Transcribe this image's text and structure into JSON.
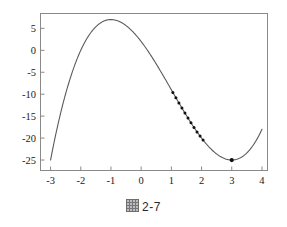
{
  "caption": {
    "symbol": "figure-glyph",
    "text": "2-7",
    "full": "图 2-7"
  },
  "chart_data": {
    "type": "line",
    "title": "",
    "xlabel": "",
    "ylabel": "",
    "xlim": [
      -3.35,
      4.2
    ],
    "ylim": [
      -27.5,
      8.5
    ],
    "grid": false,
    "legend": null,
    "function": "f(x) = x^3 - 3x^2 - 9x + 2",
    "xticks": [
      -3,
      -2,
      -1,
      0,
      1,
      2,
      3,
      4
    ],
    "xtick_labels": [
      "-3",
      "-2",
      "-1",
      "0",
      "1",
      "2",
      "3",
      "4"
    ],
    "yticks": [
      5,
      0,
      -5,
      -10,
      -15,
      -20,
      -25
    ],
    "ytick_labels": [
      "5",
      "0",
      "-5",
      "-10",
      "-15",
      "-20",
      "-25"
    ],
    "curve_color": "#5a5a5a",
    "marker_color": "#101010",
    "axis_color": "#8a8a8a",
    "series": [
      {
        "name": "cubic-curve",
        "x": [
          -3.0,
          -2.8,
          -2.6,
          -2.4,
          -2.2,
          -2.0,
          -1.8,
          -1.6,
          -1.4,
          -1.2,
          -1.0,
          -0.8,
          -0.6,
          -0.4,
          -0.2,
          0.0,
          0.2,
          0.4,
          0.6,
          0.8,
          1.0,
          1.2,
          1.4,
          1.6,
          1.8,
          2.0,
          2.2,
          2.4,
          2.6,
          2.8,
          3.0,
          3.2,
          3.4,
          3.6,
          3.8,
          4.0
        ],
        "y": [
          -25.0,
          -18.67,
          -11.82,
          -5.5,
          0.31,
          4.0,
          7.05,
          9.02,
          10.18,
          10.75,
          7.0,
          6.77,
          5.7,
          4.16,
          2.33,
          2.0,
          -0.31,
          -2.82,
          -5.46,
          -8.21,
          -9.0,
          -11.21,
          -13.74,
          -16.18,
          -18.47,
          -20.0,
          -21.67,
          -22.98,
          -23.94,
          -24.57,
          -25.0,
          -25.07,
          -24.82,
          -24.22,
          -23.21,
          -18.0
        ]
      },
      {
        "name": "iteration-points",
        "marker": "filled-circle",
        "x": [
          1.05,
          1.15,
          1.25,
          1.35,
          1.45,
          1.55,
          1.65,
          1.75,
          1.85,
          1.95,
          2.05
        ],
        "y": [
          -10.0,
          -10.9,
          -11.8,
          -12.7,
          -13.6,
          -14.5,
          -15.4,
          -16.3,
          -17.2,
          -18.1,
          -19.0
        ]
      },
      {
        "name": "minimum-point",
        "marker": "filled-circle",
        "x": [
          3.0
        ],
        "y": [
          -25.4
        ]
      }
    ]
  }
}
